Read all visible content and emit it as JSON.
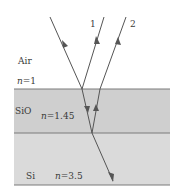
{
  "diagram": {
    "layers": [
      {
        "name": "Air",
        "index_label": "n = 1",
        "n_symbol": "n",
        "n_value": "1",
        "color": "#ffffff"
      },
      {
        "name": "SiO",
        "index_label": "n = 1.45",
        "n_symbol": "n",
        "n_value": "1.45",
        "color": "#cfcfcf"
      },
      {
        "name": "Si",
        "index_label": "n = 3.5",
        "n_symbol": "n",
        "n_value": "3.5",
        "color": "#dadada"
      }
    ],
    "rays": [
      {
        "id": "incident",
        "label": ""
      },
      {
        "id": "reflected-1",
        "label": "1"
      },
      {
        "id": "reflected-2",
        "label": "2"
      },
      {
        "id": "transmitted",
        "label": ""
      }
    ],
    "colors": {
      "ray": "#555555",
      "boundary": "#7a7a7a",
      "text": "#3a3a3a"
    }
  }
}
